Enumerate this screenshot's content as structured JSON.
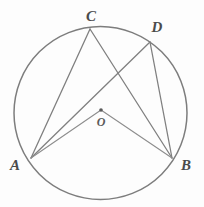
{
  "figure": {
    "background_color": "#fdfdfd",
    "stroke_color": "#7d7d7d",
    "label_color": "#4b4b4b",
    "circle": {
      "center_x": 100.5,
      "center_y": 113,
      "radius": 86.5
    },
    "center_point": {
      "name": "O",
      "x": 101,
      "y": 110,
      "dot_radius": 1.8
    },
    "points": [
      {
        "id": "A",
        "label": "A",
        "x": 31,
        "y": 158,
        "label_x": 15,
        "label_y": 165
      },
      {
        "id": "B",
        "label": "B",
        "x": 172,
        "y": 158,
        "label_x": 186,
        "label_y": 165
      },
      {
        "id": "C",
        "label": "C",
        "x": 90,
        "y": 29,
        "label_x": 91,
        "label_y": 16
      },
      {
        "id": "D",
        "label": "D",
        "x": 150,
        "y": 42,
        "label_x": 157,
        "label_y": 27
      },
      {
        "id": "O",
        "label": "O",
        "x": 101,
        "y": 110,
        "label_x": 101,
        "label_y": 122
      }
    ],
    "segments": [
      {
        "name": "segment-AC",
        "from": "A",
        "to": "C",
        "x1": 31,
        "y1": 158,
        "x2": 90,
        "y2": 29
      },
      {
        "name": "segment-AD",
        "from": "A",
        "to": "D",
        "x1": 31,
        "y1": 158,
        "x2": 150,
        "y2": 42
      },
      {
        "name": "segment-CB",
        "from": "C",
        "to": "B",
        "x1": 90,
        "y1": 29,
        "x2": 172,
        "y2": 158
      },
      {
        "name": "segment-DB",
        "from": "D",
        "to": "B",
        "x1": 150,
        "y1": 42,
        "x2": 172,
        "y2": 158
      },
      {
        "name": "segment-OA",
        "from": "O",
        "to": "A",
        "x1": 101,
        "y1": 110,
        "x2": 31,
        "y2": 158
      },
      {
        "name": "segment-OB",
        "from": "O",
        "to": "B",
        "x1": 101,
        "y1": 110,
        "x2": 172,
        "y2": 158
      }
    ]
  }
}
